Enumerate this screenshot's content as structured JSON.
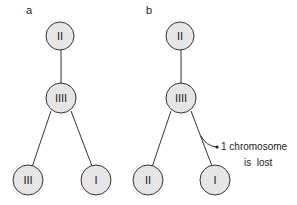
{
  "panels": [
    {
      "label": "a",
      "nodes": {
        "top": "II",
        "middle": "IIII",
        "left": "III",
        "right": "I"
      }
    },
    {
      "label": "b",
      "nodes": {
        "top": "II",
        "middle": "IIII",
        "left": "II",
        "right": "I"
      },
      "annotation": {
        "line1": "1 chromosome",
        "line2": "is  lost"
      }
    }
  ],
  "colors": {
    "node_fill": "#e6e6e6",
    "stroke": "#333333"
  }
}
